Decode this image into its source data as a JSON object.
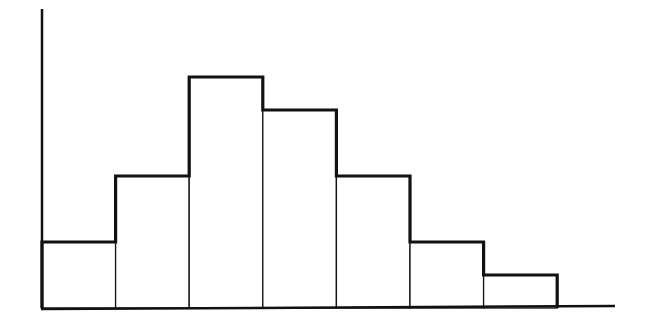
{
  "chart_data": {
    "type": "bar",
    "subtype": "histogram",
    "title": "",
    "xlabel": "",
    "ylabel": "",
    "categories": [
      "bin 1",
      "bin 2",
      "bin 3",
      "bin 4",
      "bin 5",
      "bin 6",
      "bin 7"
    ],
    "values": [
      2,
      4,
      7,
      6,
      4,
      2,
      1
    ],
    "ylim": [
      0,
      9
    ],
    "grid": false,
    "legend": null,
    "tick_labels_visible": false,
    "style": {
      "outline_color": "#111111",
      "fill_color": "#ffffff",
      "background": "#ffffff"
    }
  }
}
